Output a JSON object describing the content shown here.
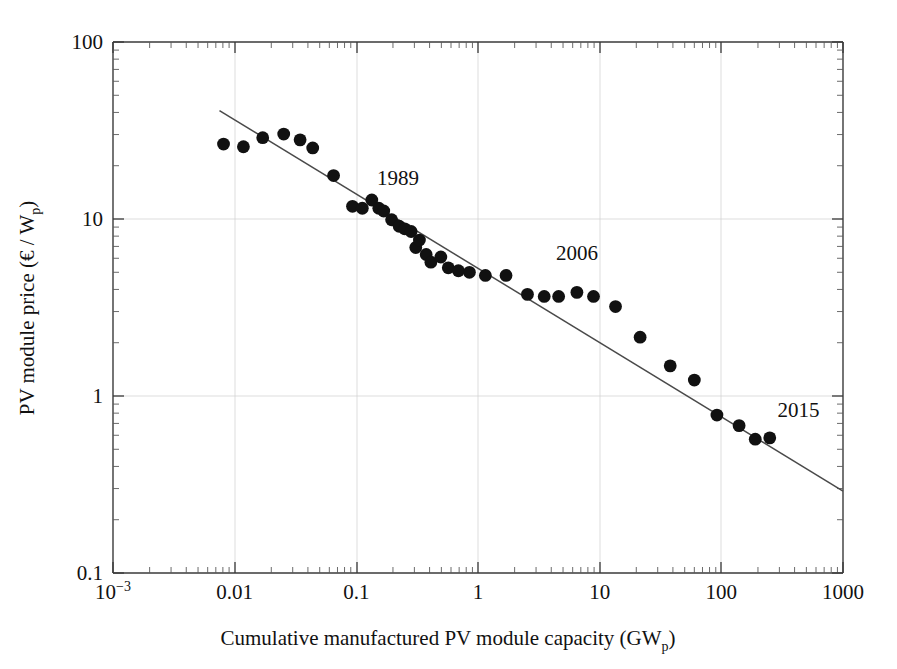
{
  "chart_data": {
    "type": "scatter",
    "title": "",
    "xlabel": "Cumulative manufactured PV module capacity (GW",
    "xlabel_sub": "p",
    "xlabel_tail": ")",
    "ylabel": "PV module price (€ / W",
    "ylabel_sub": "p",
    "ylabel_tail": ")",
    "xscale": "log",
    "yscale": "log",
    "xlim": [
      0.001,
      1000
    ],
    "ylim": [
      0.1,
      100
    ],
    "grid": true,
    "grid_style": "faint decade gridlines",
    "legend": "none",
    "xticks": [
      "10⁻³",
      "0.01",
      "0.1",
      "1",
      "10",
      "100",
      "1000"
    ],
    "xtick_values": [
      0.001,
      0.01,
      0.1,
      1,
      10,
      100,
      1000
    ],
    "yticks": [
      "0.1",
      "1",
      "10",
      "100"
    ],
    "ytick_values": [
      0.1,
      1,
      10,
      100
    ],
    "xtick_display": [
      {
        "label": "10",
        "sup": "-3",
        "value": 0.001
      },
      {
        "label": "0.01",
        "sup": "",
        "value": 0.01
      },
      {
        "label": "0.1",
        "sup": "",
        "value": 0.1
      },
      {
        "label": "1",
        "sup": "",
        "value": 1
      },
      {
        "label": "10",
        "sup": "",
        "value": 10
      },
      {
        "label": "100",
        "sup": "",
        "value": 100
      },
      {
        "label": "1000",
        "sup": "",
        "value": 1000
      }
    ],
    "series": [
      {
        "name": "PV module price vs cumulative capacity",
        "marker": "filled-circle",
        "color": "#111111",
        "points": [
          {
            "x": 0.0081,
            "y": 26.5
          },
          {
            "x": 0.0118,
            "y": 25.6
          },
          {
            "x": 0.017,
            "y": 28.8
          },
          {
            "x": 0.0253,
            "y": 30.2
          },
          {
            "x": 0.0345,
            "y": 28.0
          },
          {
            "x": 0.0438,
            "y": 25.2
          },
          {
            "x": 0.065,
            "y": 17.6
          },
          {
            "x": 0.093,
            "y": 11.8
          },
          {
            "x": 0.112,
            "y": 11.5
          },
          {
            "x": 0.134,
            "y": 12.8
          },
          {
            "x": 0.153,
            "y": 11.5
          },
          {
            "x": 0.168,
            "y": 11.1
          },
          {
            "x": 0.195,
            "y": 9.9
          },
          {
            "x": 0.225,
            "y": 9.1
          },
          {
            "x": 0.25,
            "y": 8.8
          },
          {
            "x": 0.282,
            "y": 8.5
          },
          {
            "x": 0.308,
            "y": 6.9
          },
          {
            "x": 0.33,
            "y": 7.6
          },
          {
            "x": 0.375,
            "y": 6.3
          },
          {
            "x": 0.41,
            "y": 5.7
          },
          {
            "x": 0.495,
            "y": 6.1
          },
          {
            "x": 0.57,
            "y": 5.3
          },
          {
            "x": 0.69,
            "y": 5.1
          },
          {
            "x": 0.85,
            "y": 5.0
          },
          {
            "x": 1.15,
            "y": 4.8
          },
          {
            "x": 1.7,
            "y": 4.8
          },
          {
            "x": 2.55,
            "y": 3.75
          },
          {
            "x": 3.5,
            "y": 3.65
          },
          {
            "x": 4.6,
            "y": 3.65
          },
          {
            "x": 6.5,
            "y": 3.85
          },
          {
            "x": 8.9,
            "y": 3.65
          },
          {
            "x": 13.5,
            "y": 3.2
          },
          {
            "x": 21.5,
            "y": 2.15
          },
          {
            "x": 38.0,
            "y": 1.48
          },
          {
            "x": 60.0,
            "y": 1.23
          },
          {
            "x": 92.0,
            "y": 0.78
          },
          {
            "x": 140.0,
            "y": 0.68
          },
          {
            "x": 190.0,
            "y": 0.57
          },
          {
            "x": 250.0,
            "y": 0.58
          }
        ]
      }
    ],
    "trendline": {
      "name": "experience curve fit",
      "color": "#4a4a4a",
      "x_start": 0.0075,
      "y_start": 41.0,
      "x_end": 1000,
      "y_end": 0.29
    },
    "annotations": [
      {
        "text": "1989",
        "x": 0.22,
        "y": 17.0,
        "data_x": 0.065,
        "data_y": 17.6
      },
      {
        "text": "2006",
        "x": 6.5,
        "y": 6.4,
        "data_x": 6.5,
        "data_y": 3.85
      },
      {
        "text": "2015",
        "x": 430,
        "y": 0.83,
        "data_x": 250,
        "data_y": 0.58
      }
    ]
  }
}
